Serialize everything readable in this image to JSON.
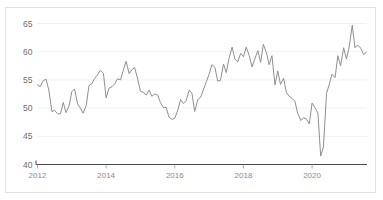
{
  "chart_title": "PMI",
  "colors": {
    "line": "#8f8f8f",
    "grid": "#ededed",
    "axis": "#4a4a4a",
    "border": "#e2e2e2",
    "background": "#ffffff",
    "tick_text": "#8a8a8a"
  },
  "axis": {
    "y_ticks": [
      "65",
      "60",
      "55",
      "50",
      "45",
      "40"
    ],
    "x_ticks": [
      "2012",
      "2014",
      "2016",
      "2018",
      "2020"
    ]
  },
  "chart_data": {
    "type": "line",
    "title": "PMI",
    "subtitle": "",
    "xlabel": "",
    "ylabel": "",
    "xlim": [
      2012.0,
      2021.6
    ],
    "ylim": [
      40,
      65
    ],
    "grid": true,
    "legend": false,
    "legend_position": "none",
    "y_tick_values": [
      40,
      45,
      50,
      55,
      60,
      65
    ],
    "x_tick_values": [
      2012,
      2014,
      2016,
      2018,
      2020
    ],
    "series": [
      {
        "name": "PMI",
        "color": "#8f8f8f",
        "x": [
          2012.0,
          2012.08,
          2012.17,
          2012.25,
          2012.33,
          2012.42,
          2012.5,
          2012.58,
          2012.67,
          2012.75,
          2012.83,
          2012.92,
          2013.0,
          2013.08,
          2013.17,
          2013.25,
          2013.33,
          2013.42,
          2013.5,
          2013.58,
          2013.67,
          2013.75,
          2013.83,
          2013.92,
          2014.0,
          2014.08,
          2014.17,
          2014.25,
          2014.33,
          2014.42,
          2014.5,
          2014.58,
          2014.67,
          2014.75,
          2014.83,
          2014.92,
          2015.0,
          2015.08,
          2015.17,
          2015.25,
          2015.33,
          2015.42,
          2015.5,
          2015.58,
          2015.67,
          2015.75,
          2015.83,
          2015.92,
          2016.0,
          2016.08,
          2016.17,
          2016.25,
          2016.33,
          2016.42,
          2016.5,
          2016.58,
          2016.67,
          2016.75,
          2016.83,
          2016.92,
          2017.0,
          2017.08,
          2017.17,
          2017.25,
          2017.33,
          2017.42,
          2017.5,
          2017.58,
          2017.67,
          2017.75,
          2017.83,
          2017.92,
          2018.0,
          2018.08,
          2018.17,
          2018.25,
          2018.33,
          2018.42,
          2018.5,
          2018.58,
          2018.67,
          2018.75,
          2018.83,
          2018.92,
          2019.0,
          2019.08,
          2019.17,
          2019.25,
          2019.33,
          2019.42,
          2019.5,
          2019.58,
          2019.67,
          2019.75,
          2019.83,
          2019.92,
          2020.0,
          2020.08,
          2020.17,
          2020.25,
          2020.33,
          2020.42,
          2020.5,
          2020.58,
          2020.67,
          2020.75,
          2020.83,
          2020.92,
          2021.0,
          2021.08,
          2021.17,
          2021.25,
          2021.33,
          2021.42,
          2021.5,
          2021.58
        ],
        "values": [
          54.1,
          53.8,
          54.9,
          55.1,
          53.2,
          49.4,
          49.6,
          49.0,
          49.0,
          51.0,
          49.2,
          50.4,
          52.9,
          53.4,
          50.7,
          50.0,
          49.1,
          50.5,
          54.0,
          54.3,
          55.3,
          55.9,
          56.7,
          56.2,
          51.8,
          53.5,
          53.8,
          54.3,
          55.2,
          55.0,
          56.7,
          58.3,
          56.1,
          56.8,
          57.2,
          55.1,
          53.0,
          52.8,
          52.3,
          53.2,
          52.1,
          52.5,
          52.3,
          51.0,
          50.1,
          50.1,
          48.4,
          48.0,
          48.2,
          49.5,
          51.5,
          50.8,
          51.3,
          53.2,
          52.6,
          49.4,
          51.5,
          51.9,
          53.2,
          54.7,
          56.0,
          57.7,
          57.2,
          54.8,
          54.9,
          57.8,
          56.3,
          58.8,
          60.8,
          58.7,
          58.2,
          59.7,
          59.1,
          60.8,
          59.3,
          57.3,
          58.7,
          60.2,
          58.1,
          61.3,
          59.8,
          57.7,
          59.3,
          54.1,
          56.6,
          54.2,
          55.3,
          52.8,
          52.1,
          51.7,
          51.2,
          49.1,
          47.8,
          48.3,
          48.1,
          47.2,
          50.9,
          50.1,
          49.1,
          41.5,
          43.1,
          52.6,
          54.2,
          56.0,
          55.4,
          59.3,
          57.5,
          60.7,
          58.7,
          60.8,
          64.7,
          60.7,
          61.2,
          60.6,
          59.5,
          59.9
        ]
      }
    ]
  }
}
